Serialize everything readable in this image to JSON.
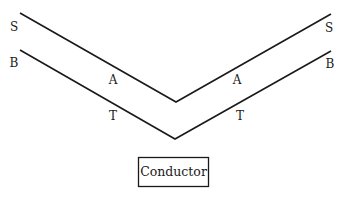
{
  "diagram": {
    "type": "v-shaped parallel lines",
    "line_color": "#1a1a1a",
    "upper_line": {
      "points": [
        [
          20,
          13
        ],
        [
          176,
          102
        ],
        [
          331,
          14
        ]
      ],
      "left_end_label": "S",
      "right_end_label": "S",
      "left_arm_label": "A",
      "right_arm_label": "A"
    },
    "lower_line": {
      "points": [
        [
          20,
          50
        ],
        [
          175,
          139
        ],
        [
          331,
          51
        ]
      ],
      "left_end_label": "B",
      "right_end_label": "B",
      "left_arm_label": "T",
      "right_arm_label": "T"
    },
    "box": {
      "label": "Conductor"
    }
  }
}
